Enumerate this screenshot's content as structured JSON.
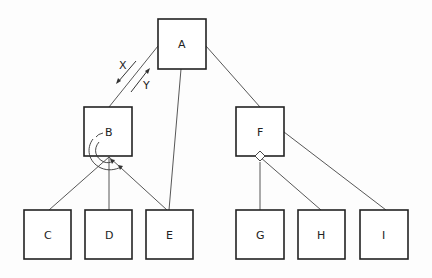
{
  "diagram": {
    "type": "tree",
    "nodes": [
      {
        "id": "A",
        "label": "A",
        "x": 158,
        "y": 19,
        "w": 48,
        "h": 50
      },
      {
        "id": "B",
        "label": "B",
        "x": 84,
        "y": 107,
        "w": 48,
        "h": 49
      },
      {
        "id": "F",
        "label": "F",
        "x": 236,
        "y": 107,
        "w": 48,
        "h": 49
      },
      {
        "id": "C",
        "label": "C",
        "x": 24,
        "y": 210,
        "w": 47,
        "h": 49
      },
      {
        "id": "D",
        "label": "D",
        "x": 85,
        "y": 210,
        "w": 47,
        "h": 49
      },
      {
        "id": "E",
        "label": "E",
        "x": 146,
        "y": 210,
        "w": 47,
        "h": 49
      },
      {
        "id": "G",
        "label": "G",
        "x": 236,
        "y": 210,
        "w": 48,
        "h": 49
      },
      {
        "id": "H",
        "label": "H",
        "x": 298,
        "y": 210,
        "w": 47,
        "h": 49
      },
      {
        "id": "I",
        "label": "I",
        "x": 360,
        "y": 210,
        "w": 48,
        "h": 49
      }
    ],
    "edges": [
      {
        "from": "A",
        "to": "B"
      },
      {
        "from": "A",
        "to": "E"
      },
      {
        "from": "A",
        "to": "F"
      },
      {
        "from": "B",
        "to": "C"
      },
      {
        "from": "B",
        "to": "D"
      },
      {
        "from": "B",
        "to": "E"
      },
      {
        "from": "F",
        "to": "G"
      },
      {
        "from": "F",
        "to": "H"
      },
      {
        "from": "F",
        "to": "I"
      }
    ],
    "arrow_labels": {
      "down": "X",
      "up": "Y"
    },
    "annotations": {
      "B_sequence_arc": "curved arrows under B indicating ordered iteration over children",
      "F_diamond": "diamond marker on F's bottom edge (selection/choice)"
    }
  }
}
